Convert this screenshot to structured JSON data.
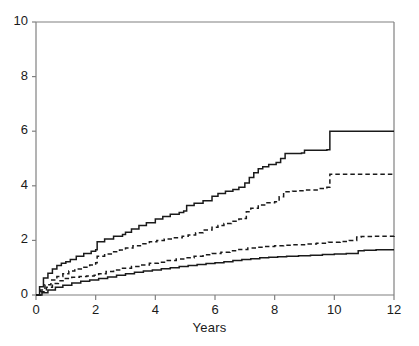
{
  "chart_data": {
    "type": "line",
    "title": "",
    "subtitle": "",
    "xlabel": "Years",
    "ylabel": "",
    "xlim": [
      0,
      12
    ],
    "ylim": [
      0,
      10
    ],
    "xticks": [
      0,
      2,
      4,
      6,
      8,
      10,
      12
    ],
    "yticks": [
      0,
      2,
      4,
      6,
      8,
      10
    ],
    "xtick_labels": [
      "0",
      "2",
      "4",
      "6",
      "8",
      "10",
      "12"
    ],
    "ytick_labels": [
      "0",
      "2",
      "4",
      "6",
      "8",
      "10"
    ],
    "grid": false,
    "legend": "none",
    "step_style": "post",
    "series": [
      {
        "name": "upper-solid",
        "style": "solid",
        "color": "#1a1a1a",
        "x": [
          0,
          0.12,
          0.25,
          0.4,
          0.55,
          0.7,
          0.85,
          1.0,
          1.15,
          1.35,
          1.6,
          1.85,
          2.0,
          2.05,
          2.3,
          2.6,
          2.9,
          3.0,
          3.2,
          3.45,
          3.7,
          4.0,
          4.25,
          4.5,
          4.8,
          4.95,
          5.05,
          5.3,
          5.6,
          5.9,
          6.1,
          6.35,
          6.6,
          6.8,
          7.0,
          7.15,
          7.3,
          7.45,
          7.6,
          7.8,
          8.05,
          8.2,
          8.35,
          8.9,
          9.0,
          9.75,
          9.85,
          12.0
        ],
        "y": [
          0,
          0.3,
          0.62,
          0.8,
          0.95,
          1.08,
          1.16,
          1.22,
          1.3,
          1.42,
          1.52,
          1.6,
          1.66,
          1.95,
          2.05,
          2.15,
          2.22,
          2.3,
          2.42,
          2.55,
          2.65,
          2.78,
          2.88,
          2.96,
          3.02,
          3.08,
          3.28,
          3.36,
          3.45,
          3.62,
          3.72,
          3.8,
          3.86,
          3.95,
          4.1,
          4.3,
          4.48,
          4.62,
          4.7,
          4.78,
          4.85,
          5.0,
          5.18,
          5.2,
          5.3,
          5.32,
          6.0,
          6.0
        ]
      },
      {
        "name": "upper-dashed",
        "style": "dashed",
        "color": "#1a1a1a",
        "x": [
          0,
          0.15,
          0.3,
          0.5,
          0.7,
          0.9,
          1.1,
          1.3,
          1.55,
          1.8,
          2.0,
          2.05,
          2.3,
          2.55,
          2.8,
          3.0,
          3.25,
          3.5,
          3.8,
          4.05,
          4.3,
          4.6,
          4.9,
          5.1,
          5.35,
          5.6,
          5.9,
          6.1,
          6.3,
          6.55,
          6.8,
          6.95,
          7.05,
          7.2,
          7.45,
          7.7,
          8.0,
          8.15,
          8.3,
          8.6,
          8.8,
          9.0,
          9.5,
          9.75,
          9.85,
          12.0
        ],
        "y": [
          0,
          0.18,
          0.38,
          0.55,
          0.68,
          0.78,
          0.88,
          0.95,
          1.02,
          1.1,
          1.18,
          1.42,
          1.5,
          1.58,
          1.65,
          1.72,
          1.8,
          1.88,
          1.95,
          2.0,
          2.05,
          2.1,
          2.15,
          2.2,
          2.28,
          2.38,
          2.48,
          2.55,
          2.62,
          2.7,
          2.78,
          2.8,
          3.05,
          3.18,
          3.3,
          3.38,
          3.42,
          3.6,
          3.78,
          3.8,
          3.82,
          3.85,
          3.9,
          3.95,
          4.42,
          4.45
        ]
      },
      {
        "name": "lower-dashed",
        "style": "dashed",
        "color": "#1a1a1a",
        "x": [
          0,
          0.15,
          0.35,
          0.55,
          0.75,
          0.95,
          1.2,
          1.45,
          1.7,
          1.95,
          2.1,
          2.35,
          2.6,
          2.9,
          3.2,
          3.5,
          3.8,
          4.1,
          4.4,
          4.7,
          5.0,
          5.3,
          5.6,
          5.9,
          6.2,
          6.5,
          6.8,
          7.1,
          7.4,
          7.7,
          8.0,
          8.3,
          8.6,
          9.0,
          9.4,
          9.8,
          10.2,
          10.5,
          10.75,
          10.9,
          11.3,
          12.0
        ],
        "y": [
          0,
          0.12,
          0.28,
          0.42,
          0.52,
          0.6,
          0.65,
          0.68,
          0.7,
          0.72,
          0.78,
          0.86,
          0.92,
          0.98,
          1.04,
          1.1,
          1.16,
          1.2,
          1.26,
          1.32,
          1.36,
          1.42,
          1.47,
          1.52,
          1.57,
          1.62,
          1.67,
          1.72,
          1.75,
          1.78,
          1.8,
          1.82,
          1.84,
          1.87,
          1.9,
          1.93,
          1.96,
          2.0,
          2.12,
          2.14,
          2.15,
          2.16
        ]
      },
      {
        "name": "lower-solid",
        "style": "solid",
        "color": "#1a1a1a",
        "x": [
          0,
          0.2,
          0.4,
          0.65,
          0.9,
          1.2,
          1.5,
          1.8,
          2.1,
          2.4,
          2.7,
          3.0,
          3.3,
          3.6,
          3.9,
          4.2,
          4.5,
          4.8,
          5.1,
          5.4,
          5.7,
          6.0,
          6.3,
          6.6,
          6.9,
          7.2,
          7.5,
          7.8,
          8.1,
          8.4,
          8.8,
          9.2,
          9.6,
          10.0,
          10.4,
          10.8,
          11.0,
          11.4,
          12.0
        ],
        "y": [
          0,
          0.08,
          0.18,
          0.28,
          0.36,
          0.44,
          0.5,
          0.55,
          0.6,
          0.66,
          0.72,
          0.78,
          0.83,
          0.88,
          0.92,
          0.96,
          1.0,
          1.04,
          1.08,
          1.12,
          1.15,
          1.18,
          1.22,
          1.26,
          1.3,
          1.33,
          1.36,
          1.38,
          1.4,
          1.42,
          1.44,
          1.46,
          1.48,
          1.5,
          1.52,
          1.62,
          1.64,
          1.66,
          1.66
        ]
      }
    ]
  },
  "axes": {
    "xlabel": "Years",
    "x_tick_labels": [
      "0",
      "2",
      "4",
      "6",
      "8",
      "10",
      "12"
    ],
    "y_tick_labels": [
      "0",
      "2",
      "4",
      "6",
      "8",
      "10"
    ],
    "axis_color": "#808080",
    "line_color": "#1a1a1a"
  }
}
